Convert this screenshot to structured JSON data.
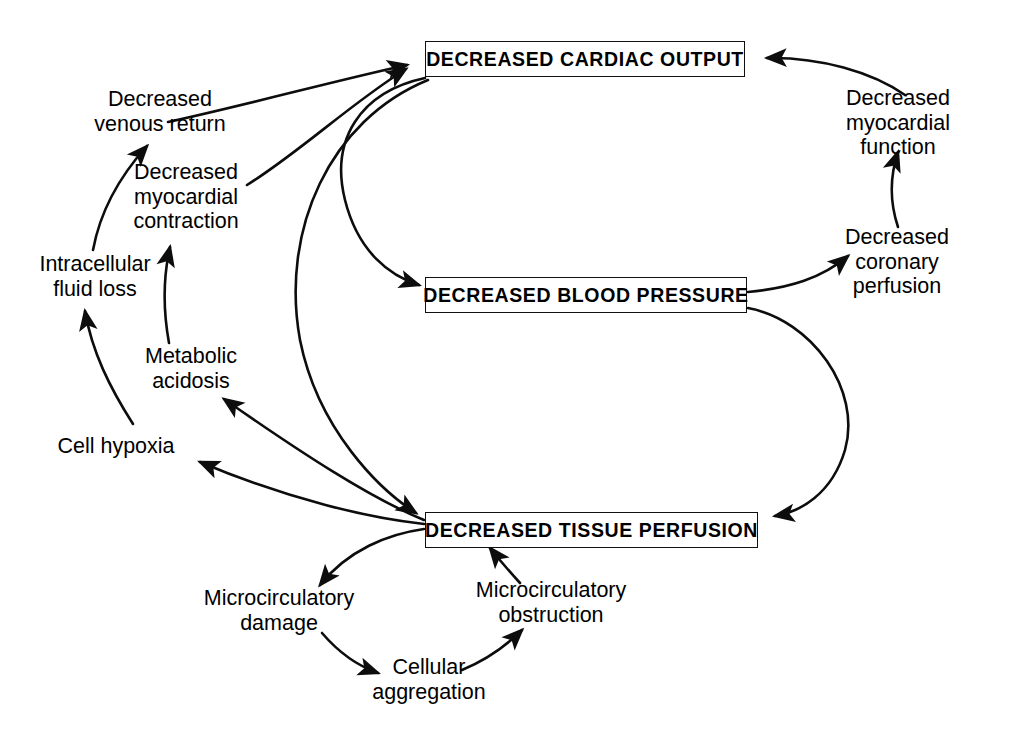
{
  "diagram": {
    "background_color": "#ffffff",
    "line_color": "#0d0d0d",
    "boxes": [
      {
        "id": "cardiac_output",
        "text": "DECREASED CARDIAC OUTPUT"
      },
      {
        "id": "blood_pressure",
        "text": "DECREASED BLOOD PRESSURE"
      },
      {
        "id": "tissue_perfusion",
        "text": "DECREASED TISSUE PERFUSION"
      }
    ],
    "labels": [
      {
        "id": "venous_return",
        "text": "Decreased\nvenous return"
      },
      {
        "id": "myocardial_contraction",
        "text": "Decreased\nmyocardial\ncontraction"
      },
      {
        "id": "intracellular_fluid_loss",
        "text": "Intracellular\nfluid loss"
      },
      {
        "id": "metabolic_acidosis",
        "text": "Metabolic\nacidosis"
      },
      {
        "id": "cell_hypoxia",
        "text": "Cell hypoxia"
      },
      {
        "id": "microcirculatory_damage",
        "text": "Microcirculatory\ndamage"
      },
      {
        "id": "cellular_aggregation",
        "text": "Cellular\naggregation"
      },
      {
        "id": "microcirculatory_obstruction",
        "text": "Microcirculatory\nobstruction"
      },
      {
        "id": "myocardial_function",
        "text": "Decreased\nmyocardial function"
      },
      {
        "id": "coronary_perfusion",
        "text": "Decreased\ncoronary perfusion"
      }
    ],
    "edges": [
      {
        "from": "venous_return",
        "to": "cardiac_output"
      },
      {
        "from": "myocardial_contraction",
        "to": "cardiac_output"
      },
      {
        "from": "myocardial_function",
        "to": "cardiac_output"
      },
      {
        "from": "cardiac_output",
        "to": "blood_pressure"
      },
      {
        "from": "cardiac_output",
        "to": "tissue_perfusion"
      },
      {
        "from": "blood_pressure",
        "to": "coronary_perfusion"
      },
      {
        "from": "blood_pressure",
        "to": "tissue_perfusion"
      },
      {
        "from": "coronary_perfusion",
        "to": "myocardial_function"
      },
      {
        "from": "tissue_perfusion",
        "to": "cell_hypoxia"
      },
      {
        "from": "tissue_perfusion",
        "to": "metabolic_acidosis"
      },
      {
        "from": "cell_hypoxia",
        "to": "intracellular_fluid_loss"
      },
      {
        "from": "intracellular_fluid_loss",
        "to": "venous_return"
      },
      {
        "from": "metabolic_acidosis",
        "to": "myocardial_contraction"
      },
      {
        "from": "tissue_perfusion",
        "to": "microcirculatory_damage"
      },
      {
        "from": "microcirculatory_damage",
        "to": "cellular_aggregation"
      },
      {
        "from": "cellular_aggregation",
        "to": "microcirculatory_obstruction"
      },
      {
        "from": "microcirculatory_obstruction",
        "to": "tissue_perfusion"
      }
    ]
  }
}
